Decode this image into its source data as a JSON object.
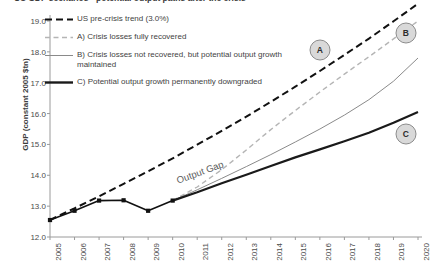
{
  "chart_data": {
    "type": "line",
    "title": "US GDP scenarios - potential output paths after the crisis",
    "xlabel": "",
    "ylabel": "GDP (constant 2005 $tn)",
    "xlim": [
      2005,
      2020
    ],
    "ylim": [
      12.0,
      19.0
    ],
    "grid": false,
    "legend_position": "top-left",
    "x": [
      2005,
      2006,
      2007,
      2008,
      2009,
      2010,
      2011,
      2012,
      2013,
      2014,
      2015,
      2016,
      2017,
      2018,
      2019,
      2020
    ],
    "xticklabels": [
      "2005",
      "2006",
      "2007",
      "2008",
      "2009",
      "2010",
      "2011",
      "2012",
      "2013",
      "2014",
      "2015",
      "2016",
      "2017",
      "2018",
      "2019",
      "2020"
    ],
    "yticklabels": [
      "12.0",
      "13.0",
      "14.0",
      "15.0",
      "16.0",
      "17.0",
      "18.0",
      "19.0"
    ],
    "series": [
      {
        "name": "US pre-crisis trend (3.0%)",
        "style": "dashed",
        "color": "#111111",
        "width": 2.0,
        "values": [
          12.55,
          12.93,
          13.32,
          13.72,
          14.13,
          14.55,
          14.99,
          15.44,
          15.9,
          16.38,
          16.87,
          17.38,
          17.9,
          18.43,
          18.99,
          19.56
        ]
      },
      {
        "name": "A) Crisis losses fully recovered",
        "style": "dashed",
        "color": "#b5b5b5",
        "width": 1.4,
        "values": [
          null,
          null,
          null,
          null,
          null,
          13.18,
          13.62,
          14.18,
          14.82,
          15.48,
          16.1,
          16.7,
          17.28,
          17.84,
          18.42,
          19.0
        ]
      },
      {
        "name": "B) Crisis losses not recovered, but potential output growth maintained",
        "style": "solid",
        "color": "#8a8a8a",
        "width": 1.0,
        "values": [
          null,
          null,
          null,
          null,
          null,
          13.18,
          13.53,
          13.9,
          14.28,
          14.67,
          15.08,
          15.5,
          15.95,
          16.45,
          17.05,
          17.8
        ]
      },
      {
        "name": "C) Potential output growth permanently downgraded",
        "style": "solid",
        "color": "#1a1a1a",
        "width": 2.2,
        "values": [
          null,
          null,
          null,
          null,
          null,
          13.18,
          13.45,
          13.74,
          14.02,
          14.3,
          14.58,
          14.84,
          15.1,
          15.38,
          15.7,
          16.05
        ]
      },
      {
        "name": "Actual GDP (history)",
        "style": "solid-marker",
        "color": "#111111",
        "width": 1.6,
        "values": [
          12.55,
          12.85,
          13.18,
          13.19,
          12.85,
          13.18,
          null,
          null,
          null,
          null,
          null,
          null,
          null,
          null,
          null,
          null
        ]
      }
    ],
    "annotations": [
      {
        "label": "Output Gap",
        "x": 2011.1,
        "y": 14.1,
        "rotation": -20
      },
      {
        "label": "A",
        "type": "circle",
        "x": 2016.0,
        "y": 18.05
      },
      {
        "label": "B",
        "type": "circle",
        "x": 2019.5,
        "y": 18.6
      },
      {
        "label": "C",
        "type": "circle",
        "x": 2019.5,
        "y": 15.33
      }
    ]
  },
  "legend": {
    "items": [
      {
        "label": "US pre-crisis trend (3.0%)",
        "key": "dashed-black-key"
      },
      {
        "label": "A) Crisis losses fully recovered",
        "key": "dashed-gray-key"
      },
      {
        "label": "B) Crisis losses not recovered, but potential output growth maintained",
        "key": "solid-thin-gray-key"
      },
      {
        "label": "C) Potential output growth permanently downgraded",
        "key": "solid-thick-black-key"
      }
    ]
  }
}
